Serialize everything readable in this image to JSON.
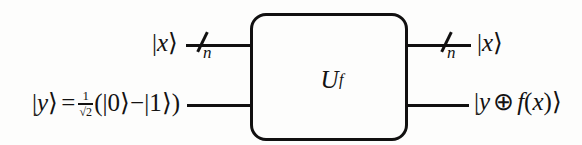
{
  "diagram": {
    "gate": {
      "symbol": "U",
      "subscript": "f",
      "name": "oracle-gate"
    },
    "inputs": {
      "top": {
        "ket_open": "|",
        "variable": "x",
        "ket_close": "⟩",
        "register_width": "n",
        "slash_icon": "register-slash"
      },
      "bottom": {
        "ket_open": "|",
        "variable": "y",
        "ket_close": "⟩",
        "equals": "=",
        "fraction_numerator": "1",
        "fraction_denominator": "√2",
        "expression_open": "(|",
        "zero": "0",
        "mid": "⟩−|",
        "one": "1",
        "expression_close": "⟩)"
      }
    },
    "outputs": {
      "top": {
        "ket_open": "|",
        "variable": "x",
        "ket_close": "⟩",
        "register_width": "n",
        "slash_icon": "register-slash"
      },
      "bottom": {
        "ket_open": "|",
        "variable": "y",
        "operator": "⊕",
        "function": "f",
        "arg_open": "(",
        "argument": "x",
        "arg_close": ")",
        "ket_close": "⟩"
      }
    },
    "colors": {
      "ink": "#131212",
      "wire": "#111010",
      "background": "#fdfdfc"
    }
  }
}
